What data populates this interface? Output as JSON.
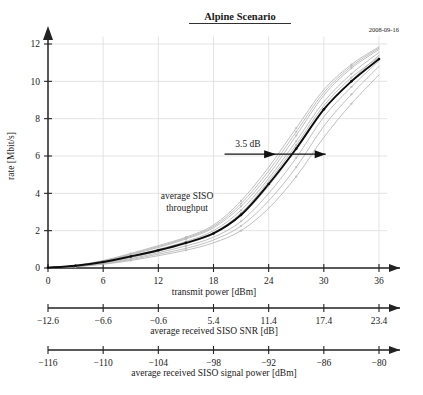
{
  "title": "Alpine Scenario",
  "date_stamp": "2008-09-16",
  "annotations": {
    "gain_label": "3.5 dB",
    "curve_label_line1": "average SISO",
    "curve_label_line2": "throughput"
  },
  "chart_data": {
    "type": "line",
    "title": "Alpine Scenario",
    "xlabel": "transmit power [dBm]",
    "ylabel": "rate [Mbit/s]",
    "xlim": [
      0,
      36
    ],
    "ylim": [
      0,
      12.6
    ],
    "grid": true,
    "legend": "none",
    "x_ticks": [
      0,
      6,
      12,
      18,
      24,
      30,
      36
    ],
    "x_tick_labels": [
      "0",
      "6",
      "12",
      "18",
      "24",
      "30",
      "36"
    ],
    "y_ticks": [
      0,
      2,
      4,
      6,
      8,
      10,
      12
    ],
    "y_tick_labels": [
      "0",
      "2",
      "4",
      "6",
      "8",
      "10",
      "12"
    ],
    "secondary_axes": [
      {
        "label": "average received SISO SNR [dB]",
        "ticks": [
          0,
          6,
          12,
          18,
          24,
          30,
          36
        ],
        "tick_labels": [
          "−12.6",
          "−6.6",
          "−0.6",
          "5.4",
          "11.4",
          "17.4",
          "23.4"
        ]
      },
      {
        "label": "average received SISO signal power [dBm]",
        "ticks": [
          0,
          6,
          12,
          18,
          24,
          30,
          36
        ],
        "tick_labels": [
          "−116",
          "−110",
          "−104",
          "−98",
          "−92",
          "−86",
          "−80"
        ]
      }
    ],
    "annotation_arrow": {
      "text": "3.5 dB",
      "y_value": 6.1,
      "x_start": 19.2,
      "x_end": 30.2
    },
    "x": [
      0,
      3,
      6,
      9,
      12,
      15,
      18,
      21,
      24,
      27,
      30,
      33,
      36
    ],
    "series": [
      {
        "name": "average SISO throughput",
        "style": "bold",
        "color": "#0d0d0d",
        "values": [
          0.02,
          0.12,
          0.32,
          0.62,
          0.95,
          1.35,
          1.85,
          2.85,
          4.5,
          6.4,
          8.5,
          10.0,
          11.2
        ]
      },
      {
        "name": "run 1",
        "style": "light",
        "color": "#b4b4b4",
        "values": [
          0.02,
          0.14,
          0.4,
          0.78,
          1.2,
          1.65,
          2.3,
          3.6,
          5.4,
          7.5,
          9.55,
          10.9,
          11.85
        ]
      },
      {
        "name": "run 2",
        "style": "light",
        "color": "#b4b4b4",
        "values": [
          0.02,
          0.12,
          0.36,
          0.7,
          1.1,
          1.55,
          2.15,
          3.3,
          5.0,
          7.1,
          9.25,
          10.7,
          11.7
        ]
      },
      {
        "name": "run 3",
        "style": "light",
        "color": "#b4b4b4",
        "values": [
          0.02,
          0.11,
          0.32,
          0.62,
          1.0,
          1.42,
          2.0,
          3.1,
          4.8,
          6.8,
          8.9,
          10.4,
          11.55
        ]
      },
      {
        "name": "run 4",
        "style": "light",
        "color": "#b4b4b4",
        "values": [
          0.02,
          0.1,
          0.28,
          0.56,
          0.9,
          1.3,
          1.82,
          2.8,
          4.4,
          6.35,
          8.5,
          10.05,
          11.4
        ]
      },
      {
        "name": "run 5",
        "style": "light",
        "color": "#b4b4b4",
        "values": [
          0.01,
          0.09,
          0.26,
          0.5,
          0.82,
          1.18,
          1.65,
          2.5,
          4.0,
          5.9,
          8.1,
          9.7,
          11.1
        ]
      },
      {
        "name": "run 6",
        "style": "light",
        "color": "#b4b4b4",
        "values": [
          0.01,
          0.08,
          0.22,
          0.45,
          0.74,
          1.05,
          1.5,
          2.25,
          3.6,
          5.4,
          7.6,
          9.3,
          10.8
        ],
        "markers": true
      },
      {
        "name": "run 7",
        "style": "light",
        "color": "#bdbdbd",
        "values": [
          0.01,
          0.07,
          0.2,
          0.4,
          0.66,
          0.95,
          1.35,
          2.0,
          3.2,
          4.9,
          7.0,
          8.8,
          10.35
        ]
      },
      {
        "name": "run 8",
        "style": "light",
        "color": "#c4c4c4",
        "values": [
          0.02,
          0.13,
          0.38,
          0.74,
          1.15,
          1.6,
          2.22,
          3.45,
          5.2,
          7.3,
          9.4,
          10.8,
          11.78
        ]
      },
      {
        "name": "run 9",
        "style": "light",
        "color": "#c8c8c8",
        "values": [
          0.02,
          0.1,
          0.3,
          0.58,
          0.93,
          1.33,
          1.88,
          2.95,
          4.65,
          6.6,
          8.7,
          10.2,
          11.3
        ]
      }
    ]
  }
}
